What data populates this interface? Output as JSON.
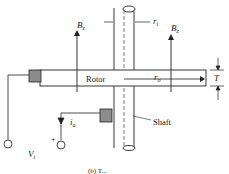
{
  "diagram": {
    "labels": {
      "rotor": "Rotor",
      "shaft": "Shaft",
      "bz_left": "B",
      "bz_right": "B",
      "bz_sub": "z",
      "ri": "r",
      "ri_sub": "i",
      "ro": "r",
      "ro_sub": "o",
      "thickness": "T",
      "ia": "i",
      "ia_sub": "a",
      "vt": "V",
      "vt_sub": "t",
      "plus": "+",
      "caption": "(b) T..."
    },
    "colors": {
      "line": "#222222",
      "brush": "#8c8c8c",
      "background": "#ffffff"
    }
  }
}
